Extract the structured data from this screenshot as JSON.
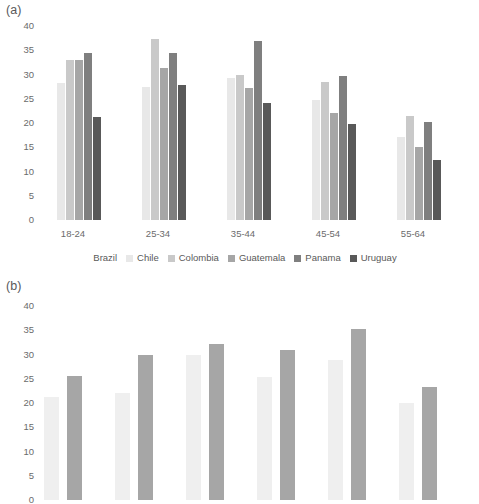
{
  "figure": {
    "panels": [
      {
        "id": "a",
        "label": "(a)"
      },
      {
        "id": "b",
        "label": "(b)"
      }
    ]
  },
  "palette": {
    "brazil": "#ffffff",
    "chile": "#e8e8e8",
    "colombia": "#c9c9c9",
    "guatemala": "#a6a6a6",
    "panama": "#7f7f7f",
    "uruguay": "#595959",
    "series_b_1": "#efefef",
    "series_b_2": "#a6a6a6",
    "text": "#595959",
    "tick_text": "#6b6b6b",
    "background": "#ffffff"
  },
  "legend_a": {
    "position": "bottom-center",
    "entries": [
      {
        "label": "Brazil",
        "color": "#ffffff"
      },
      {
        "label": "Chile",
        "color": "#e8e8e8"
      },
      {
        "label": "Colombia",
        "color": "#c9c9c9"
      },
      {
        "label": "Guatemala",
        "color": "#a6a6a6"
      },
      {
        "label": "Panama",
        "color": "#7f7f7f"
      },
      {
        "label": "Uruguay",
        "color": "#595959"
      }
    ]
  },
  "chart_data": [
    {
      "type": "bar",
      "panel": "(a)",
      "title": "",
      "xlabel": "",
      "ylabel": "",
      "ylim": [
        0,
        40
      ],
      "yticks": [
        0,
        5,
        10,
        15,
        20,
        25,
        30,
        35,
        40
      ],
      "grid": false,
      "legend": "bottom",
      "categories": [
        "18-24",
        "25-34",
        "35-44",
        "45-54",
        "55-64"
      ],
      "note": "Last category 55-64 is clipped at the right image edge",
      "series": [
        {
          "name": "Brazil",
          "color": "#ffffff",
          "values": [
            null,
            null,
            null,
            null,
            null
          ]
        },
        {
          "name": "Chile",
          "color": "#e8e8e8",
          "values": [
            28.3,
            27.4,
            29.3,
            24.8,
            17.2
          ]
        },
        {
          "name": "Colombia",
          "color": "#c9c9c9",
          "values": [
            33.0,
            37.4,
            30.0,
            28.5,
            21.5
          ]
        },
        {
          "name": "Guatemala",
          "color": "#a6a6a6",
          "values": [
            32.9,
            31.4,
            27.3,
            22.1,
            15.1
          ]
        },
        {
          "name": "Panama",
          "color": "#7f7f7f",
          "values": [
            34.4,
            34.5,
            37.0,
            29.7,
            20.3
          ]
        },
        {
          "name": "Uruguay",
          "color": "#595959",
          "values": [
            21.2,
            27.9,
            24.1,
            19.7,
            12.3
          ]
        }
      ]
    },
    {
      "type": "bar",
      "panel": "(b)",
      "title": "",
      "xlabel": "",
      "ylabel": "",
      "ylim": [
        0,
        40
      ],
      "yticks": [
        0,
        5,
        10,
        15,
        20,
        25,
        30,
        35,
        40
      ],
      "grid": false,
      "legend": "none",
      "categories": [
        "1",
        "2",
        "3",
        "4",
        "5",
        "6"
      ],
      "note": "Panel (b) is clipped at the bottom of the image; x tick labels and legend are not visible",
      "series": [
        {
          "name": "series-1",
          "color": "#efefef",
          "values": [
            21.3,
            22.0,
            30.0,
            25.3,
            28.8,
            20.0
          ]
        },
        {
          "name": "series-2",
          "color": "#a6a6a6",
          "values": [
            25.6,
            29.9,
            32.1,
            31.0,
            35.3,
            23.4
          ]
        }
      ]
    }
  ]
}
